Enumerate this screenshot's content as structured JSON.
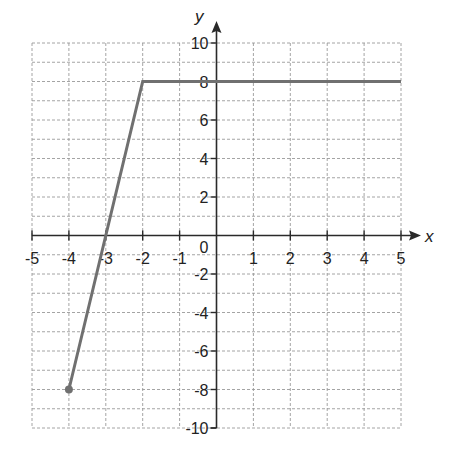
{
  "chart_data": {
    "type": "line",
    "title": "",
    "xlabel": "x",
    "ylabel": "y",
    "xlim": [
      -5,
      5
    ],
    "ylim": [
      -10,
      10
    ],
    "grid": true,
    "x_ticks": [
      -5,
      -4,
      -3,
      -2,
      -1,
      1,
      2,
      3,
      4,
      5
    ],
    "x_tick_labels": [
      "-5",
      "-4",
      "-3",
      "-2",
      "-1",
      "1",
      "2",
      "3",
      "4",
      "5"
    ],
    "y_ticks": [
      10,
      8,
      6,
      4,
      2,
      -2,
      -4,
      -6,
      -8,
      -10
    ],
    "y_tick_labels": [
      "10",
      "8",
      "6",
      "4",
      "2",
      "-2",
      "-4",
      "-6",
      "-8",
      "-10"
    ],
    "origin_label": "0",
    "series": [
      {
        "name": "piecewise",
        "points": [
          [
            -4,
            -8
          ],
          [
            -2,
            8
          ],
          [
            5,
            8
          ]
        ],
        "start_marker": "closed-dot",
        "color": "#707070"
      }
    ]
  },
  "colors": {
    "line": "#707070",
    "axis": "#2a2a2a",
    "grid": "#9a9a9a",
    "background": "#ffffff"
  }
}
